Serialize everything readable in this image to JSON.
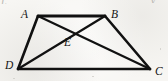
{
  "figure": {
    "background_color": "#f7f6f3",
    "stroke_color": "#111111",
    "label_color": "#141414",
    "artifact_color": "#b9b7b2",
    "canvas": {
      "width": 168,
      "height": 81
    },
    "vertices": [
      {
        "id": "A",
        "label": "A",
        "x": 38,
        "y": 16,
        "label_x": 21,
        "label_y": 9
      },
      {
        "id": "B",
        "label": "B",
        "x": 105,
        "y": 16,
        "label_x": 111,
        "label_y": 9
      },
      {
        "id": "C",
        "label": "C",
        "x": 150,
        "y": 69,
        "label_x": 155,
        "label_y": 66
      },
      {
        "id": "D",
        "label": "D",
        "x": 18,
        "y": 69,
        "label_x": 5,
        "label_y": 60
      },
      {
        "id": "E",
        "label": "E",
        "x": 70,
        "y": 33,
        "label_x": 64,
        "label_y": 37
      }
    ],
    "segments": [
      {
        "name": "segment-AB",
        "from": "A",
        "to": "B",
        "width": 3.0
      },
      {
        "name": "segment-AD",
        "from": "A",
        "to": "D",
        "width": 2.6
      },
      {
        "name": "segment-BC",
        "from": "B",
        "to": "C",
        "width": 2.6
      },
      {
        "name": "segment-DC",
        "from": "D",
        "to": "C",
        "width": 2.6
      },
      {
        "name": "diagonal-AC",
        "from": "A",
        "to": "C",
        "width": 2.2
      },
      {
        "name": "diagonal-DB",
        "from": "D",
        "to": "B",
        "width": 2.2
      }
    ],
    "intersection": {
      "name": "point-E",
      "of": [
        "diagonal-AC",
        "diagonal-DB"
      ],
      "label": "E"
    },
    "scan_artifacts": {
      "top_left_fragment": "L",
      "top_right_fragment": "V"
    }
  }
}
